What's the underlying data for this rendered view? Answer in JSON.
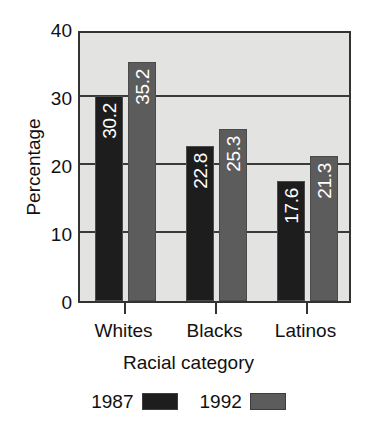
{
  "chart_data": {
    "type": "bar",
    "title": "",
    "subtitle": "",
    "xlabel": "Racial category",
    "ylabel": "Percentage",
    "categories": [
      "Whites",
      "Blacks",
      "Latinos"
    ],
    "series": [
      {
        "name": "1987",
        "color": "#1d1d1d",
        "values": [
          30.2,
          22.8,
          17.6
        ]
      },
      {
        "name": "1992",
        "color": "#5c5c5c",
        "values": [
          35.2,
          25.3,
          21.3
        ]
      }
    ],
    "data_labels": [
      [
        "30.2",
        "22.8",
        "17.6"
      ],
      [
        "35.2",
        "25.3",
        "21.3"
      ]
    ],
    "ylim": [
      0,
      40
    ],
    "yticks": [
      0,
      10,
      20,
      30,
      40
    ],
    "ytick_labels": [
      "0",
      "10",
      "20",
      "30",
      "40"
    ],
    "grid": true,
    "grid_axis": "y",
    "legend_position": "bottom",
    "legend_entries": [
      "1987",
      "1992"
    ],
    "plot_background": "#e3e3e1",
    "frame_color": "#333333",
    "label_text_color": "#ffffff"
  }
}
